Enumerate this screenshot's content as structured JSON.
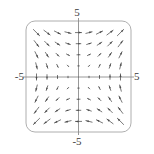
{
  "figure": {
    "type": "vector-field-plot",
    "width": 154,
    "height": 154,
    "background": "#ffffff"
  },
  "labels": {
    "top": "5",
    "bottom": "-5",
    "left": "-5",
    "right": "5"
  },
  "frame": {
    "x": 26,
    "y": 21,
    "width": 105,
    "height": 111,
    "corner_radius": 9,
    "stroke": "#9a9a9a",
    "stroke_width": 0.8
  },
  "axes": {
    "origin_px": {
      "x": 78.5,
      "y": 77.0
    },
    "x_axis": {
      "y_px": 77.0,
      "x_start_px": 23,
      "x_end_px": 134,
      "stroke": "#8c8c8c"
    },
    "y_axis": {
      "x_px": 78.5,
      "y_start_px": 18,
      "y_end_px": 135,
      "stroke": "#8c8c8c"
    }
  },
  "chart_data": {
    "type": "quiver",
    "title": "",
    "xlabel": "",
    "ylabel": "",
    "xlim": [
      -5,
      5
    ],
    "ylim": [
      -5,
      5
    ],
    "xticks": [
      -5,
      5
    ],
    "yticks": [
      -5,
      5
    ],
    "xticklabels": [
      "-5",
      "5"
    ],
    "yticklabels": [
      "-5",
      "5"
    ],
    "grid": false,
    "legend": null,
    "field": {
      "u_expression": "y",
      "v_expression": "x",
      "description": "Saddle-type vector field: arrows flow outward along the line y = x and inward along y = -x. Arrow length grows with distance from the origin."
    },
    "sampling": {
      "nx": 9,
      "ny": 9,
      "x_values": [
        -4,
        -3,
        -2,
        -1,
        0,
        1,
        2,
        3,
        4
      ],
      "y_values": [
        -4,
        -3,
        -2,
        -1,
        0,
        1,
        2,
        3,
        4
      ]
    },
    "arrow_style": {
      "color": "#4a4a4a",
      "stroke_width": 0.75,
      "head_length_px": 3.0,
      "head_width_px": 2.0,
      "scale_px_per_unit": 1.55,
      "max_length_px": 13
    }
  }
}
